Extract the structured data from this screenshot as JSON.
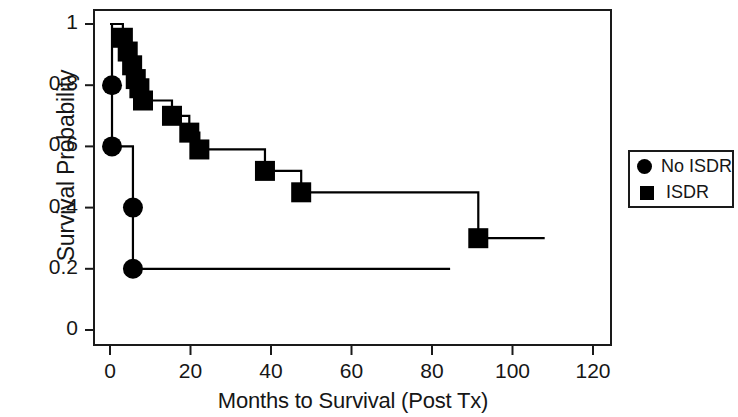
{
  "chart_data": {
    "type": "line",
    "subtype": "kaplan-meier-step",
    "title": "",
    "xlabel": "Months to Survival (Post Tx)",
    "ylabel": "Survival Probability",
    "xlim": [
      0,
      120
    ],
    "ylim": [
      0,
      1
    ],
    "grid": false,
    "legend_position": "right-outside",
    "xticks": [
      0,
      20,
      40,
      60,
      80,
      100,
      120
    ],
    "xtick_labels": [
      "0",
      "20",
      "40",
      "60",
      "80",
      "100",
      "120"
    ],
    "yticks": [
      0,
      0.2,
      0.4,
      0.6,
      0.8,
      1
    ],
    "ytick_labels": [
      "0",
      "0.2",
      "0.4",
      "0.6",
      "0.8",
      "1"
    ],
    "series": [
      {
        "name": "No ISDR",
        "marker": "circle",
        "color": "#000000",
        "points": [
          {
            "x": 0,
            "y": 1.0,
            "marked": false
          },
          {
            "x": 0.5,
            "y": 0.8,
            "marked": true
          },
          {
            "x": 0.5,
            "y": 0.6,
            "marked": true
          },
          {
            "x": 5.7,
            "y": 0.4,
            "marked": true
          },
          {
            "x": 5.7,
            "y": 0.2,
            "marked": true
          },
          {
            "x": 84.5,
            "y": 0.2,
            "marked": false
          }
        ]
      },
      {
        "name": "ISDR",
        "marker": "square",
        "color": "#000000",
        "points": [
          {
            "x": 0,
            "y": 1.0,
            "marked": false
          },
          {
            "x": 3.0,
            "y": 1.0,
            "marked": false
          },
          {
            "x": 3.2,
            "y": 0.955,
            "marked": true
          },
          {
            "x": 4.4,
            "y": 0.91,
            "marked": true
          },
          {
            "x": 5.5,
            "y": 0.865,
            "marked": true
          },
          {
            "x": 6.4,
            "y": 0.82,
            "marked": true
          },
          {
            "x": 7.3,
            "y": 0.79,
            "marked": true
          },
          {
            "x": 8.2,
            "y": 0.75,
            "marked": true
          },
          {
            "x": 15.4,
            "y": 0.7,
            "marked": true
          },
          {
            "x": 19.7,
            "y": 0.645,
            "marked": true
          },
          {
            "x": 22.2,
            "y": 0.59,
            "marked": true
          },
          {
            "x": 38.5,
            "y": 0.52,
            "marked": true
          },
          {
            "x": 47.5,
            "y": 0.45,
            "marked": true
          },
          {
            "x": 91.5,
            "y": 0.3,
            "marked": true
          },
          {
            "x": 108.0,
            "y": 0.3,
            "marked": false
          }
        ]
      }
    ]
  },
  "legend": {
    "entries": [
      {
        "label": "No ISDR",
        "marker": "circle"
      },
      {
        "label": "ISDR",
        "marker": "square"
      }
    ]
  },
  "axes": {
    "y_title": "Survival Probability",
    "x_title": "Months to Survival (Post Tx)"
  }
}
